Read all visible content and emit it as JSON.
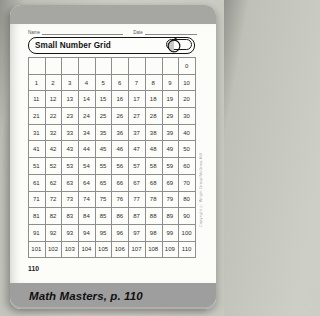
{
  "header": {
    "name_label": "Name",
    "date_label": "Date",
    "title": "Small Number Grid",
    "icon": "apple-icon"
  },
  "grid": {
    "rows": 12,
    "cols": 10,
    "cells": [
      [
        "",
        "",
        "",
        "",
        "",
        "",
        "",
        "",
        "",
        "0"
      ],
      [
        "1",
        "2",
        "3",
        "4",
        "5",
        "6",
        "7",
        "8",
        "9",
        "10"
      ],
      [
        "11",
        "12",
        "13",
        "14",
        "15",
        "16",
        "17",
        "18",
        "19",
        "20"
      ],
      [
        "21",
        "22",
        "23",
        "24",
        "25",
        "26",
        "27",
        "28",
        "29",
        "30"
      ],
      [
        "31",
        "32",
        "33",
        "34",
        "35",
        "36",
        "37",
        "38",
        "39",
        "40"
      ],
      [
        "41",
        "42",
        "43",
        "44",
        "45",
        "46",
        "47",
        "48",
        "49",
        "50"
      ],
      [
        "51",
        "52",
        "53",
        "54",
        "55",
        "56",
        "57",
        "58",
        "59",
        "60"
      ],
      [
        "61",
        "62",
        "63",
        "64",
        "65",
        "66",
        "67",
        "68",
        "69",
        "70"
      ],
      [
        "71",
        "72",
        "73",
        "74",
        "75",
        "76",
        "77",
        "78",
        "79",
        "80"
      ],
      [
        "81",
        "82",
        "83",
        "84",
        "85",
        "86",
        "87",
        "88",
        "89",
        "90"
      ],
      [
        "91",
        "92",
        "93",
        "94",
        "95",
        "96",
        "97",
        "98",
        "99",
        "100"
      ],
      [
        "101",
        "102",
        "103",
        "104",
        "105",
        "106",
        "107",
        "108",
        "109",
        "110"
      ]
    ]
  },
  "page": {
    "page_number": "110",
    "copyright_vertical": "Copyright © Wright Group/McGraw-Hill"
  },
  "footer": {
    "text": "Math Masters, p. 110"
  },
  "colors": {
    "card_top_bar": "#a6a6a2",
    "footer_bar": "#9e9e9e",
    "page_background": "#fcfcf9",
    "grid_line": "#8e8e8e",
    "title_border": "#141414"
  }
}
